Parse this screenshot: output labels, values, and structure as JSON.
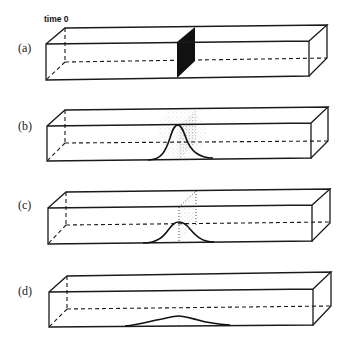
{
  "figure": {
    "time_label": "time 0",
    "colors": {
      "line": "#1a1a1a",
      "plane_solid": "#111111",
      "stipple": "#555555",
      "background": "#ffffff"
    },
    "panels": [
      {
        "id": "a",
        "label": "(a)",
        "state": "initial concentrated solute plane at time 0"
      },
      {
        "id": "b",
        "label": "(b)",
        "state": "solute begins diffusing, sharp peak"
      },
      {
        "id": "c",
        "label": "(c)",
        "state": "further diffusion, broader lower peak"
      },
      {
        "id": "d",
        "label": "(d)",
        "state": "nearly uniform distribution, very low broad peak"
      }
    ]
  }
}
